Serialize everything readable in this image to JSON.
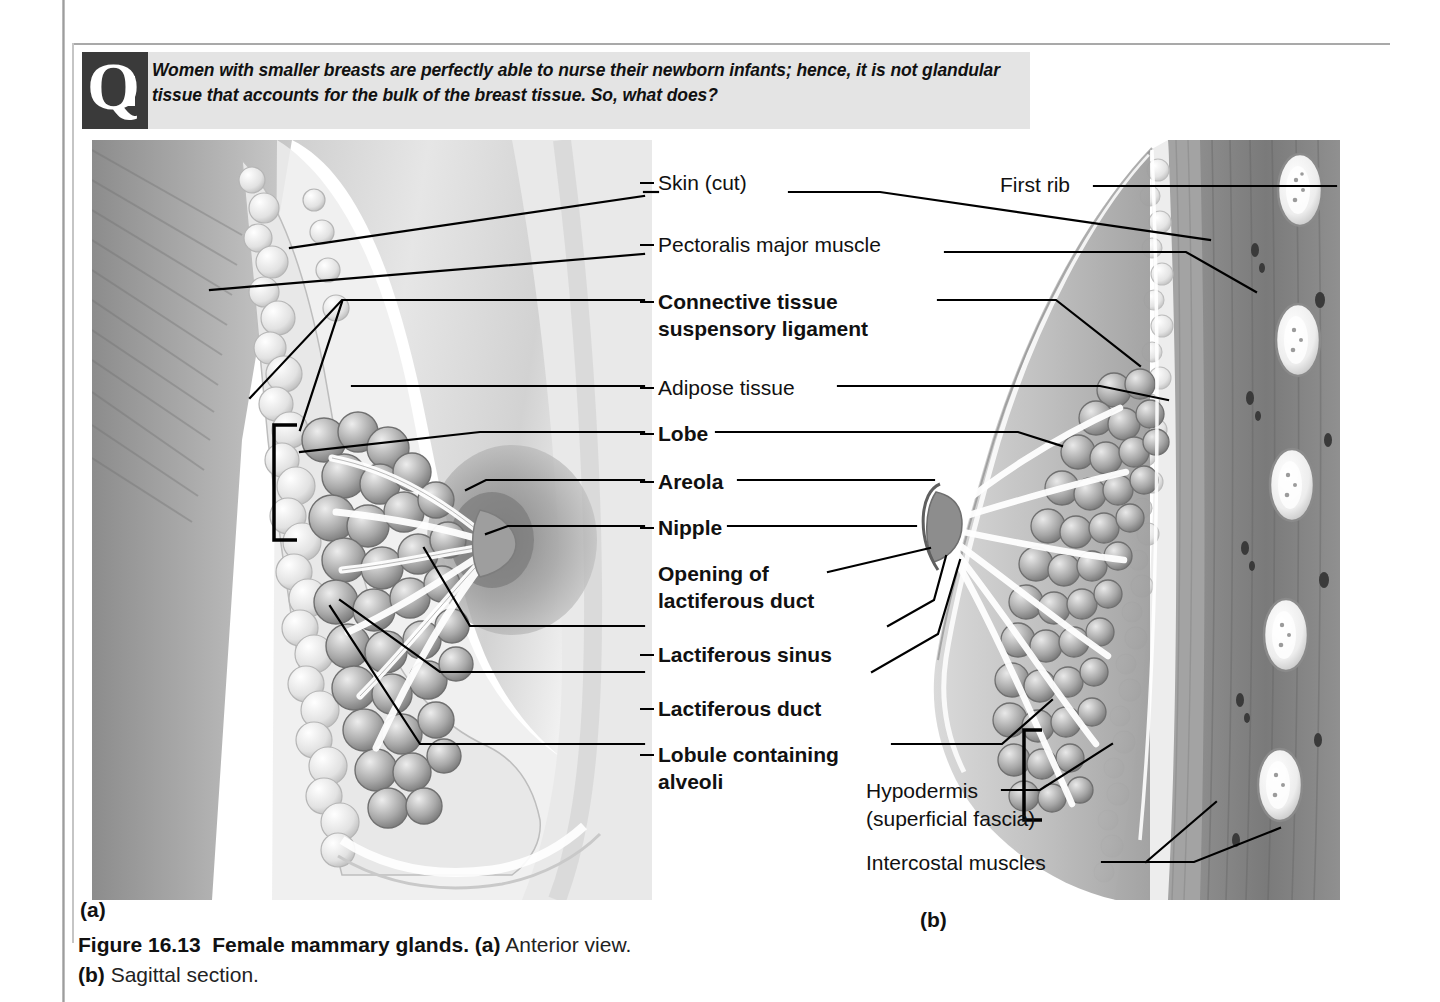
{
  "question_banner": {
    "marker": "Q",
    "text": "Women with smaller breasts are perfectly able to nurse their newborn infants; hence, it is not glandular tissue that accounts for the bulk of the breast tissue. So, what does?"
  },
  "center_labels": [
    {
      "id": "skin-cut",
      "text": "Skin (cut)",
      "bold": false,
      "x": 18,
      "y": 0,
      "dash_x": 0,
      "dash_w": 14
    },
    {
      "id": "pectoralis",
      "text": "Pectoralis major muscle",
      "bold": false,
      "x": 18,
      "y": 62,
      "dash_x": 0,
      "dash_w": 14
    },
    {
      "id": "connective-1",
      "text": "Connective tissue",
      "bold": true,
      "x": 18,
      "y": 119,
      "dash_x": 0,
      "dash_w": 14
    },
    {
      "id": "connective-2",
      "text": "suspensory ligament",
      "bold": true,
      "x": 18,
      "y": 146,
      "dash_x": -1,
      "dash_w": 0
    },
    {
      "id": "adipose",
      "text": "Adipose tissue",
      "bold": false,
      "x": 18,
      "y": 205,
      "dash_x": 0,
      "dash_w": 14
    },
    {
      "id": "lobe",
      "text": "Lobe",
      "bold": true,
      "x": 18,
      "y": 251,
      "dash_x": 0,
      "dash_w": 14
    },
    {
      "id": "areola",
      "text": "Areola",
      "bold": true,
      "x": 18,
      "y": 299,
      "dash_x": 0,
      "dash_w": 14
    },
    {
      "id": "nipple",
      "text": "Nipple",
      "bold": true,
      "x": 18,
      "y": 345,
      "dash_x": 0,
      "dash_w": 14
    },
    {
      "id": "opening-1",
      "text": "Opening of",
      "bold": true,
      "x": 18,
      "y": 391,
      "dash_x": -1,
      "dash_w": 0
    },
    {
      "id": "opening-2",
      "text": "lactiferous duct",
      "bold": true,
      "x": 18,
      "y": 418,
      "dash_x": -1,
      "dash_w": 0
    },
    {
      "id": "lactiferous-sinus",
      "text": "Lactiferous sinus",
      "bold": true,
      "x": 18,
      "y": 472,
      "dash_x": 0,
      "dash_w": 14
    },
    {
      "id": "lactiferous-duct",
      "text": "Lactiferous duct",
      "bold": true,
      "x": 18,
      "y": 526,
      "dash_x": 0,
      "dash_w": 14
    },
    {
      "id": "lobule-1",
      "text": "Lobule containing",
      "bold": true,
      "x": 18,
      "y": 572,
      "dash_x": 0,
      "dash_w": 14
    },
    {
      "id": "lobule-2",
      "text": "alveoli",
      "bold": true,
      "x": 18,
      "y": 599,
      "dash_x": -1,
      "dash_w": 0
    }
  ],
  "right_labels": [
    {
      "id": "first-rib",
      "text": "First rib",
      "x": 1000,
      "y": 172
    },
    {
      "id": "hypodermis-1",
      "text": "Hypodermis",
      "x": 866,
      "y": 782
    },
    {
      "id": "hypodermis-2",
      "text": "(superficial fascia)",
      "x": 866,
      "y": 810
    },
    {
      "id": "intercostal",
      "text": "Intercostal muscles",
      "x": 866,
      "y": 854
    }
  ],
  "panel_letters": [
    {
      "id": "panel-a",
      "text": "(a)",
      "x": 80,
      "y": 898
    },
    {
      "id": "panel-b",
      "text": "(b)",
      "x": 920,
      "y": 908
    }
  ],
  "caption": {
    "figure_number": "Figure 16.13",
    "title": "Female mammary glands.",
    "part_a_letter": "(a)",
    "part_a_text": "Anterior view.",
    "part_b_letter": "(b)",
    "part_b_text": "Sagittal section."
  },
  "colors": {
    "banner_background": "#e4e4e4",
    "q_marker_background": "#3a3a3a",
    "text": "#111111",
    "leader_line": "#000000",
    "gutter": "#9d9d9d"
  },
  "figure": {
    "type": "anatomical-illustration",
    "subject": "Female mammary gland",
    "views": [
      "Anterior view",
      "Sagittal section"
    ],
    "rendering": "grayscale medical illustration"
  }
}
